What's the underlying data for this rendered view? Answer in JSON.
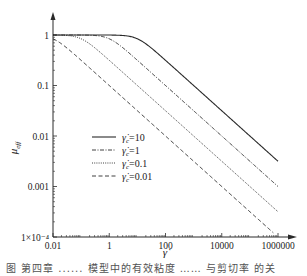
{
  "chart_data": {
    "type": "line",
    "title": "",
    "xlabel": "γ̇",
    "ylabel": "μ_eff",
    "xscale": "log",
    "yscale": "log",
    "xlim": [
      0.01,
      1000000
    ],
    "ylim": [
      0.0001,
      1
    ],
    "x_ticks": [
      {
        "value": 0.01,
        "label": "0.01"
      },
      {
        "value": 1,
        "label": "1"
      },
      {
        "value": 100,
        "label": "100"
      },
      {
        "value": 10000,
        "label": "10000"
      },
      {
        "value": 1000000,
        "label": "1000000"
      }
    ],
    "y_ticks": [
      {
        "value": 1,
        "label": "1"
      },
      {
        "value": 0.1,
        "label": "0.1"
      },
      {
        "value": 0.01,
        "label": "0.01"
      },
      {
        "value": 0.001,
        "label": "0.001"
      },
      {
        "value": 0.0001,
        "label": "1×10⁻⁴"
      }
    ],
    "grid": false,
    "legend_position": "center-left",
    "model": "mu = (1 + (gamma/gamma_c)^2)^(-1/4)",
    "series": [
      {
        "name": "γ̇c=10",
        "legend_label": "=10",
        "gamma_c": 10,
        "dash": "",
        "x": [
          0.01,
          1,
          10,
          100,
          10000,
          1000000
        ],
        "y": [
          1.0,
          0.998,
          0.841,
          0.316,
          0.0316,
          0.00316
        ]
      },
      {
        "name": "γ̇c=1",
        "legend_label": "=1",
        "gamma_c": 1,
        "dash": "4,1.5,1,1.5",
        "x": [
          0.01,
          0.1,
          1,
          100,
          10000,
          1000000
        ],
        "y": [
          1.0,
          0.998,
          0.841,
          0.1,
          0.01,
          0.001
        ]
      },
      {
        "name": "γ̇c=0.1",
        "legend_label": "=0.1",
        "gamma_c": 0.1,
        "dash": "1,1.2",
        "x": [
          0.01,
          0.1,
          1,
          100,
          10000,
          1000000
        ],
        "y": [
          0.998,
          0.841,
          0.316,
          0.0316,
          0.00316,
          0.000316
        ]
      },
      {
        "name": "γ̇c=0.01",
        "legend_label": "=0.01",
        "gamma_c": 0.01,
        "dash": "4,2.5",
        "x": [
          0.01,
          1,
          100,
          10000,
          1000000
        ],
        "y": [
          0.841,
          0.1,
          0.01,
          0.001,
          0.0001
        ]
      }
    ]
  },
  "legend": {
    "symbol": "γ̇",
    "subscript": "c",
    "items": [
      "=10",
      "=1",
      "=0.1",
      "=0.01"
    ]
  },
  "axes": {
    "x_label": "γ̇",
    "y_label_main": "μ",
    "y_label_sub": "eff"
  },
  "caption": "图 第四章 ...... 模型中的有效粘度 …… 与剪切率 的关"
}
